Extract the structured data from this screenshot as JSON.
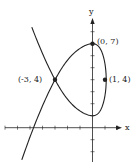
{
  "figure": {
    "type": "parametric curve",
    "axes": {
      "x_label": "x",
      "y_label": "y"
    },
    "points": [
      {
        "label": "(0, 7)",
        "x": 0,
        "y": 7
      },
      {
        "label": "(-3, 4)",
        "x": -3,
        "y": 4
      },
      {
        "label": "(1, 4)",
        "x": 1,
        "y": 4
      }
    ],
    "curve": {
      "x_of_t": "1 - t^2",
      "y_of_t": "4 + 4t - t^3",
      "t_range": [
        -2.42,
        2.58
      ]
    },
    "colors": {
      "stroke": "#222222",
      "background": "#ffffff"
    }
  }
}
